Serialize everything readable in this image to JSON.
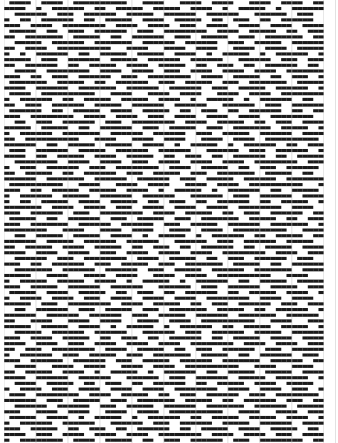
{
  "draft": {
    "columns": 60,
    "rows": 78,
    "cell_w": 5.33,
    "cell_h": 5.68,
    "colors": {
      "ink": "#1a1a1a",
      "grid": "#c8c8c8",
      "paper": "#ffffff"
    },
    "repeat_rows": [
      "011110011110011111111110001111000111100111100",
      "111100100111111001100111110011111001111001001",
      "001111110011100111111001111100111111001111110",
      "100110011111100110011111001111001111100110011",
      "111001111001111111100111100111100111001111001",
      "011111001100111001111110011100111111110011110",
      "110011111110011111001100111111001110011111001",
      "001111100111111001111111001111110011111100111"
    ]
  }
}
